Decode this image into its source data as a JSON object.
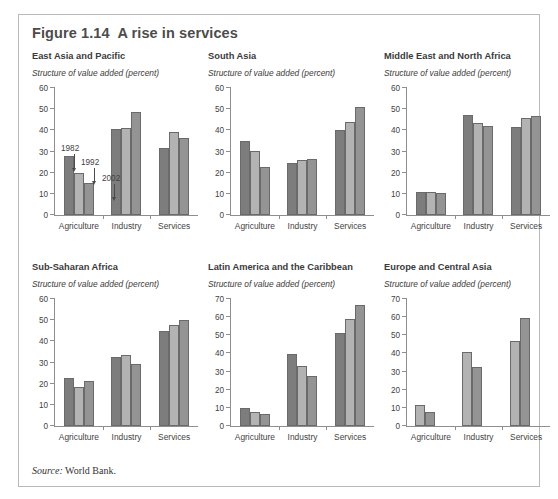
{
  "figure": {
    "title": "Figure 1.14  A rise in services",
    "source_keyword": "Source:",
    "source_text": " World Bank.",
    "subtitle_common": "Structure of value added (percent)"
  },
  "annotations": {
    "label_1982": "1982",
    "label_1992": "1992",
    "label_2002": "2002"
  },
  "colors": {
    "series_1982": "#7d7d7d",
    "series_1992": "#b3b3b3",
    "series_2002": "#949494",
    "axis": "#8e8e8e",
    "border": "#b9b9b9",
    "title_text": "#4c4c4c"
  },
  "chart_data": [
    {
      "type": "bar",
      "title": "East Asia and Pacific",
      "subtitle": "Structure of value added (percent)",
      "xlabel": "",
      "ylabel": "Structure of value added (percent)",
      "categories": [
        "Agriculture",
        "Industry",
        "Services"
      ],
      "ylim": [
        0,
        60
      ],
      "yticks": [
        0,
        10,
        20,
        30,
        40,
        50,
        60
      ],
      "grid": false,
      "legend": "annotated-arrows",
      "series": [
        {
          "name": "1982",
          "values": [
            28.0,
            40.8,
            31.5
          ]
        },
        {
          "name": "1992",
          "values": [
            19.8,
            41.2,
            39.4
          ]
        },
        {
          "name": "2002",
          "values": [
            15.0,
            48.5,
            36.5
          ]
        }
      ]
    },
    {
      "type": "bar",
      "title": "South Asia",
      "subtitle": "Structure of value added (percent)",
      "xlabel": "",
      "ylabel": "Structure of value added (percent)",
      "categories": [
        "Agriculture",
        "Industry",
        "Services"
      ],
      "ylim": [
        0,
        60
      ],
      "yticks": [
        0,
        10,
        20,
        30,
        40,
        50,
        60
      ],
      "grid": false,
      "legend": "none",
      "series": [
        {
          "name": "1982",
          "values": [
            35.0,
            24.8,
            40.4
          ]
        },
        {
          "name": "1992",
          "values": [
            30.1,
            25.9,
            44.1
          ]
        },
        {
          "name": "2002",
          "values": [
            22.9,
            26.3,
            51.2
          ]
        }
      ]
    },
    {
      "type": "bar",
      "title": "Middle East and North Africa",
      "subtitle": "Structure of value added (percent)",
      "xlabel": "",
      "ylabel": "Structure of value added (percent)",
      "categories": [
        "Agriculture",
        "Industry",
        "Services"
      ],
      "ylim": [
        0,
        60
      ],
      "yticks": [
        0,
        10,
        20,
        30,
        40,
        50,
        60
      ],
      "grid": false,
      "legend": "none",
      "series": [
        {
          "name": "1982",
          "values": [
            10.7,
            47.1,
            41.8
          ]
        },
        {
          "name": "1992",
          "values": [
            10.8,
            43.4,
            45.8
          ]
        },
        {
          "name": "2002",
          "values": [
            10.6,
            42.2,
            47.0
          ]
        }
      ]
    },
    {
      "type": "bar",
      "title": "Sub-Saharan Africa",
      "subtitle": "Structure of value added (percent)",
      "xlabel": "",
      "ylabel": "Structure of value added (percent)",
      "categories": [
        "Agriculture",
        "Industry",
        "Services"
      ],
      "ylim": [
        0,
        60
      ],
      "yticks": [
        0,
        10,
        20,
        30,
        40,
        50,
        60
      ],
      "grid": false,
      "legend": "none",
      "series": [
        {
          "name": "1982",
          "values": [
            22.6,
            32.5,
            44.9
          ]
        },
        {
          "name": "1992",
          "values": [
            18.4,
            33.7,
            47.9
          ]
        },
        {
          "name": "2002",
          "values": [
            21.1,
            29.3,
            49.9
          ]
        }
      ]
    },
    {
      "type": "bar",
      "title": "Latin America and the Caribbean",
      "subtitle": "Structure of value added (percent)",
      "xlabel": "",
      "ylabel": "Structure of value added (percent)",
      "categories": [
        "Agriculture",
        "Industry",
        "Services"
      ],
      "ylim": [
        0,
        70
      ],
      "yticks": [
        0,
        10,
        20,
        30,
        40,
        50,
        60,
        70
      ],
      "grid": false,
      "legend": "none",
      "series": [
        {
          "name": "1982",
          "values": [
            9.8,
            39.5,
            51.3
          ]
        },
        {
          "name": "1992",
          "values": [
            8.0,
            33.3,
            59.0
          ]
        },
        {
          "name": "2002",
          "values": [
            6.8,
            27.3,
            66.5
          ]
        }
      ]
    },
    {
      "type": "bar",
      "title": "Europe and Central Asia",
      "subtitle": "Structure of value added (percent)",
      "xlabel": "",
      "ylabel": "Structure of value added (percent)",
      "categories": [
        "Agriculture",
        "Industry",
        "Services"
      ],
      "ylim": [
        0,
        70
      ],
      "yticks": [
        0,
        10,
        20,
        30,
        40,
        50,
        60,
        70
      ],
      "grid": false,
      "legend": "none",
      "series": [
        {
          "name": "1992",
          "values": [
            11.7,
            40.8,
            47.0
          ]
        },
        {
          "name": "2002",
          "values": [
            7.6,
            32.3,
            59.8
          ]
        }
      ]
    }
  ]
}
